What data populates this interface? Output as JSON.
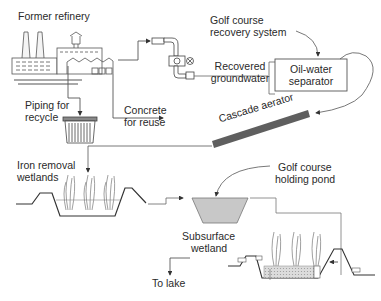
{
  "diagram": {
    "labels": {
      "former_refinery": "Former refinery",
      "golf_recovery_1": "Golf course",
      "golf_recovery_2": "recovery system",
      "recovered_1": "Recovered",
      "recovered_2": "groundwater",
      "separator_1": "Oil-water",
      "separator_2": "separator",
      "piping_1": "Piping for",
      "piping_2": "recycle",
      "concrete_1": "Concrete",
      "concrete_2": "for reuse",
      "cascade": "Cascade aerator",
      "iron_1": "Iron removal",
      "iron_2": "wetlands",
      "pond_1": "Golf course",
      "pond_2": "holding pond",
      "subsurface_1": "Subsurface",
      "subsurface_2": "wetland",
      "to_lake": "To lake"
    },
    "colors": {
      "line": "#4a4a4a",
      "aerator": "#5a5a5a",
      "pond_fill": "#c8c8c8",
      "gravel_fill": "#d8d8d8"
    }
  }
}
